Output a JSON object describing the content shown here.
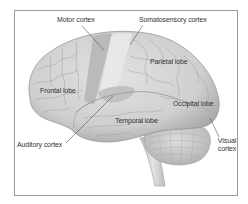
{
  "figure": {
    "type": "labeled anatomical diagram",
    "colors": {
      "frame_border": "#9a9a9a",
      "cortex": "#d4d4d4",
      "motor_cortex": "#b6b6b6",
      "somatosensory_cortex": "#e8e8e8",
      "auditory_cortex": "#bcbcbc",
      "cerebellum": "#d0d0d0",
      "brainstem": "#d8d8d8",
      "leader_line": "#555555",
      "label_text": "#333333"
    }
  },
  "labels": {
    "motor_cortex": "Motor cortex",
    "somatosensory_cortex": "Somatosensory cortex",
    "parietal_lobe": "Parietal lobe",
    "frontal_lobe": "Frontal lobe",
    "occipital_lobe": "Occipital lobe",
    "temporal_lobe": "Temporal lobe",
    "auditory_cortex": "Auditory cortex",
    "visual_cortex_line1": "Visual",
    "visual_cortex_line2": "cortex"
  }
}
